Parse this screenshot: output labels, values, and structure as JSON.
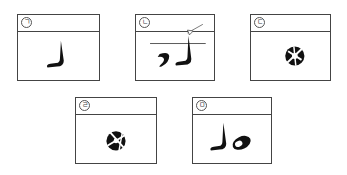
{
  "panels": [
    {
      "label": "ㄱ",
      "caption": "step 1: vertical stroke with leftward foot"
    },
    {
      "label": "ㄴ",
      "caption": "step 2: stroke crossing line, arrow marker, curved mark on left"
    },
    {
      "label": "ㄷ",
      "caption": "step 3: circle with cross lines"
    },
    {
      "label": "ㄹ",
      "caption": "step 4: circle with cross lines (rotated)"
    },
    {
      "label": "ㅁ",
      "caption": "step 5: stroke with foot and tilted oval"
    }
  ],
  "colors": {
    "border": "#444444",
    "ink": "#111111",
    "background": "#ffffff"
  }
}
